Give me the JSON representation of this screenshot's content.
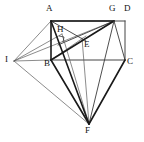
{
  "figure": {
    "background_color": "#ffffff",
    "stroke_color": "#1a1a1a",
    "thin_stroke_color": "#5a5a5a",
    "labels": [
      {
        "name": "A",
        "text": "A",
        "x": 46,
        "y": 5,
        "point_x": 51,
        "point_y": 21
      },
      {
        "name": "G",
        "text": "G",
        "x": 110,
        "y": 5,
        "point_x": 114,
        "point_y": 21
      },
      {
        "name": "D",
        "text": "D",
        "x": 125,
        "y": 5,
        "point_x": 125,
        "point_y": 21
      },
      {
        "name": "H",
        "text": "H",
        "x": 58,
        "y": 26,
        "point_x": 62,
        "point_y": 34
      },
      {
        "name": "E",
        "text": "E",
        "x": 84,
        "y": 39,
        "point_x": 82,
        "point_y": 38
      },
      {
        "name": "I",
        "text": "I",
        "x": 5,
        "y": 55,
        "point_x": 14,
        "point_y": 61
      },
      {
        "name": "B",
        "text": "B",
        "x": 44,
        "y": 61,
        "point_x": 51,
        "point_y": 60
      },
      {
        "name": "C",
        "text": "C",
        "x": 126,
        "y": 58,
        "point_x": 125,
        "point_y": 60
      },
      {
        "name": "F",
        "text": "F",
        "x": 85,
        "y": 127,
        "point_x": 89,
        "point_y": 124
      }
    ],
    "vertices": {
      "A": [
        51,
        21
      ],
      "G": [
        114,
        21
      ],
      "D": [
        125,
        21
      ],
      "H": [
        62,
        34
      ],
      "E": [
        82,
        38
      ],
      "I": [
        14,
        61
      ],
      "B": [
        51,
        60
      ],
      "C": [
        125,
        60
      ],
      "F": [
        89,
        124
      ]
    },
    "edges": [
      {
        "name": "edge-A-D",
        "from": "A",
        "to": "D",
        "weight": "frame"
      },
      {
        "name": "edge-D-C",
        "from": "D",
        "to": "C",
        "weight": "frame"
      },
      {
        "name": "edge-B-C",
        "from": "B",
        "to": "C",
        "weight": "frame"
      },
      {
        "name": "edge-A-B",
        "from": "A",
        "to": "B",
        "weight": "bold"
      },
      {
        "name": "edge-A-G",
        "from": "A",
        "to": "G",
        "weight": "bold"
      },
      {
        "name": "edge-I-A",
        "from": "I",
        "to": "A",
        "weight": "thin"
      },
      {
        "name": "edge-I-B",
        "from": "I",
        "to": "B",
        "weight": "thin"
      },
      {
        "name": "edge-I-H",
        "from": "I",
        "to": "H",
        "weight": "thin"
      },
      {
        "name": "edge-I-E",
        "from": "I",
        "to": "E",
        "weight": "thin"
      },
      {
        "name": "edge-I-G",
        "from": "I",
        "to": "G",
        "weight": "thin"
      },
      {
        "name": "edge-I-F",
        "from": "I",
        "to": "F",
        "weight": "thin"
      },
      {
        "name": "edge-A-E",
        "from": "A",
        "to": "E",
        "weight": "med"
      },
      {
        "name": "edge-A-F",
        "from": "A",
        "to": "F",
        "weight": "bold"
      },
      {
        "name": "edge-G-B",
        "from": "G",
        "to": "B",
        "weight": "bold"
      },
      {
        "name": "edge-G-H",
        "from": "G",
        "to": "H",
        "weight": "med"
      },
      {
        "name": "edge-G-F",
        "from": "G",
        "to": "F",
        "weight": "med"
      },
      {
        "name": "edge-G-C",
        "from": "G",
        "to": "C",
        "weight": "med"
      },
      {
        "name": "edge-B-F",
        "from": "B",
        "to": "F",
        "weight": "bold"
      },
      {
        "name": "edge-C-F",
        "from": "C",
        "to": "F",
        "weight": "bold"
      },
      {
        "name": "edge-H-F",
        "from": "H",
        "to": "F",
        "weight": "thin"
      },
      {
        "name": "edge-E-F",
        "from": "E",
        "to": "F",
        "weight": "thin"
      },
      {
        "name": "edge-B-E",
        "from": "B",
        "to": "E",
        "weight": "thin"
      }
    ],
    "right_angle_marker": {
      "name": "right-angle-at-H",
      "points": "60,36 64,36 64,40 60,40"
    }
  }
}
